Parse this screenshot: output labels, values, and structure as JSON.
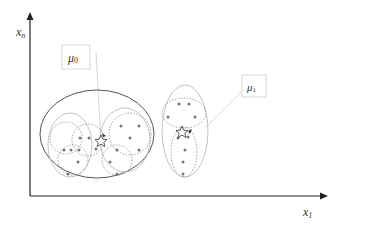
{
  "axes": {
    "x_label": "x",
    "x_sub": "1",
    "y_label": "x",
    "y_sub": "n"
  },
  "labels": {
    "mu0": {
      "sym": "μ",
      "sub": "0"
    },
    "mu1": {
      "sym": "μ",
      "sub": "1"
    }
  },
  "colors": {
    "axis": "#222222",
    "outer_ellipse": "#555555",
    "dashed": "#777777",
    "light": "#bbbbbb",
    "point": "#777777",
    "leader": "#cccccc"
  }
}
